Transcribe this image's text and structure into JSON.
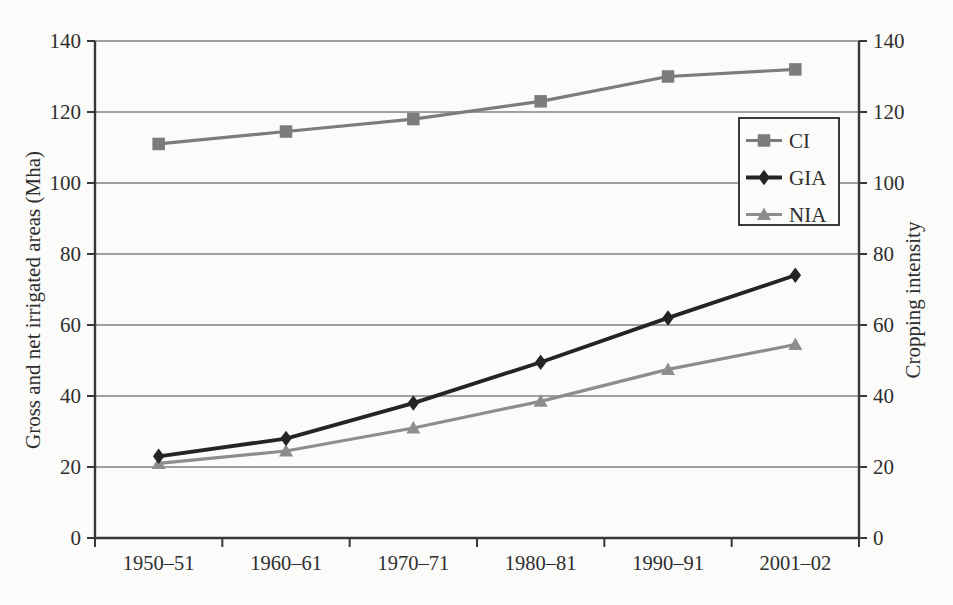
{
  "figure": {
    "background": "#fbfbf9"
  },
  "chart_data": {
    "type": "line",
    "title": "",
    "xlabel": "",
    "ylabel_left": "Gross and net irrigated areas (Mha)",
    "ylabel_right": "Cropping intensity",
    "categories": [
      "1950–51",
      "1960–61",
      "1970–71",
      "1980–81",
      "1990–91",
      "2001–02"
    ],
    "series": [
      {
        "name": "CI",
        "marker": "square",
        "axis": "right",
        "color": "#7c7c7c",
        "line_width": 3.2,
        "values": [
          111,
          114.5,
          118,
          123,
          130,
          132
        ]
      },
      {
        "name": "GIA",
        "marker": "diamond",
        "axis": "left",
        "color": "#242424",
        "line_width": 3.8,
        "values": [
          23,
          28,
          38,
          49.5,
          62,
          74
        ]
      },
      {
        "name": "NIA",
        "marker": "triangle",
        "axis": "left",
        "color": "#8d8d8d",
        "line_width": 3.2,
        "values": [
          21,
          24.5,
          31,
          38.5,
          47.5,
          54.5
        ]
      }
    ],
    "ylim": [
      0,
      140
    ],
    "yticks": [
      0,
      20,
      40,
      60,
      80,
      100,
      120,
      140
    ],
    "grid": true,
    "legend": {
      "entries": [
        "CI",
        "GIA",
        "NIA"
      ],
      "position": "inside-upper-right"
    },
    "colors": {
      "grid": "#474747",
      "axis": "#383838",
      "text": "#2e2e2e",
      "legend_border": "#262626",
      "legend_background": "#fbfbf9"
    }
  }
}
